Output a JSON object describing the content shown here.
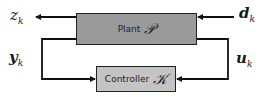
{
  "diagram": {
    "type": "feedback-control-block-diagram",
    "blocks": {
      "plant": {
        "label": "Plant",
        "symbol": "𝒫",
        "fill": "#9a9a9a"
      },
      "controller": {
        "label": "Controller",
        "symbol": "𝒦",
        "fill": "#c4c4c4"
      }
    },
    "signals": {
      "z": {
        "base": "z",
        "sub": "k"
      },
      "d": {
        "base": "d",
        "sub": "k"
      },
      "y": {
        "base": "y",
        "sub": "k"
      },
      "u": {
        "base": "u",
        "sub": "k"
      }
    },
    "edges": [
      {
        "from": "plant",
        "to": "z_k",
        "direction": "left"
      },
      {
        "from": "d_k",
        "to": "plant",
        "direction": "left"
      },
      {
        "from": "plant",
        "to": "controller",
        "signal": "y_k",
        "route": "left-loop"
      },
      {
        "from": "controller",
        "to": "plant",
        "signal": "u_k",
        "route": "right-loop"
      }
    ],
    "colors": {
      "line": "#111111",
      "background": "#ffffff"
    }
  }
}
